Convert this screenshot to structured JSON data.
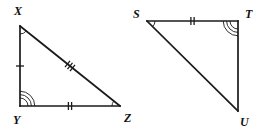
{
  "figure": {
    "stroke_color": "#1a1a1a",
    "background_color": "#ffffff",
    "label_color": "#111111"
  },
  "triangles": [
    {
      "id": "triangle-xyz",
      "name": "Triangle XYZ",
      "vertices": [
        {
          "id": "X",
          "label": "X",
          "x": 20,
          "y": 26,
          "label_x": 14,
          "label_y": 15,
          "arcs": 1
        },
        {
          "id": "Y",
          "label": "Y",
          "x": 20,
          "y": 106,
          "label_x": 13,
          "label_y": 124,
          "arcs": 3
        },
        {
          "id": "Z",
          "label": "Z",
          "x": 120,
          "y": 106,
          "label_x": 124,
          "label_y": 122,
          "arcs": 1
        }
      ],
      "sides": [
        {
          "id": "XY",
          "from": "X",
          "to": "Y",
          "ticks": 1
        },
        {
          "id": "YZ",
          "from": "Y",
          "to": "Z",
          "ticks": 2
        },
        {
          "id": "XZ",
          "from": "X",
          "to": "Z",
          "ticks": 3
        }
      ]
    },
    {
      "id": "triangle-stu",
      "name": "Triangle STU",
      "vertices": [
        {
          "id": "S",
          "label": "S",
          "x": 147,
          "y": 21,
          "label_x": 133,
          "label_y": 18,
          "arcs": 1
        },
        {
          "id": "T",
          "label": "T",
          "x": 238,
          "y": 21,
          "label_x": 245,
          "label_y": 18,
          "arcs": 3
        },
        {
          "id": "U",
          "label": "U",
          "x": 238,
          "y": 111,
          "label_x": 240,
          "label_y": 126,
          "arcs": 0
        }
      ],
      "sides": [
        {
          "id": "ST",
          "from": "S",
          "to": "T",
          "ticks": 2
        },
        {
          "id": "TU",
          "from": "T",
          "to": "U",
          "ticks": 0
        },
        {
          "id": "SU",
          "from": "S",
          "to": "U",
          "ticks": 0
        }
      ]
    }
  ],
  "legend": {
    "single_tick_meaning": "XY",
    "double_tick_meaning": "YZ and ST congruent",
    "triple_tick_meaning": "XZ",
    "single_arc_meaning": "angle X, angle Z, angle S congruent",
    "triple_arc_meaning": "angle Y and angle T congruent"
  }
}
